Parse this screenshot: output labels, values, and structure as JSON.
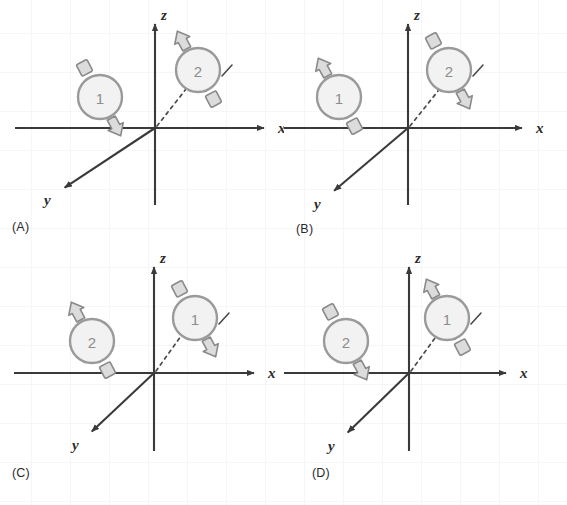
{
  "figure": {
    "type": "physics-diagram",
    "colors": {
      "axis": "#3a3a3a",
      "circle_stroke": "#9a9a9a",
      "circle_fill": "#f2f2f2",
      "arrow_stroke": "#8a8a8a",
      "arrow_fill": "#dcdcdc",
      "dash": "#4a4a4a",
      "text": "#2b2b2b",
      "number": "#8d8d8d",
      "grid": "#f6f6f7",
      "background": "#ffffff"
    },
    "axes": {
      "z_label": "z",
      "x_label": "x",
      "y_label": "y"
    }
  },
  "panels": [
    {
      "id": "A",
      "label": "(A)",
      "axes": {
        "z_label": "z",
        "x_label": "x",
        "y_label": "y"
      },
      "objects": [
        {
          "name": "circle-1",
          "number": "1",
          "position": "left-of-z-axis",
          "cx": 100,
          "cy": 97,
          "arrow_tilt_deg": -28,
          "head_end": "bottom-left",
          "tail_end": "top-right"
        },
        {
          "name": "circle-2",
          "number": "2",
          "position": "on-dashed-line",
          "cx": 198,
          "cy": 70,
          "arrow_tilt_deg": -28,
          "head_end": "top-left",
          "tail_end": "bottom-right"
        }
      ]
    },
    {
      "id": "B",
      "label": "(B)",
      "axes": {
        "z_label": "z",
        "x_label": "x",
        "y_label": "y"
      },
      "objects": [
        {
          "name": "circle-1",
          "number": "1",
          "position": "left-of-z-axis",
          "cx": 55,
          "cy": 97,
          "arrow_tilt_deg": -28,
          "head_end": "top-left",
          "tail_end": "bottom-right"
        },
        {
          "name": "circle-2",
          "number": "2",
          "position": "on-dashed-line",
          "cx": 165,
          "cy": 70,
          "arrow_tilt_deg": -28,
          "head_end": "bottom-left",
          "tail_end": "top-right"
        }
      ]
    },
    {
      "id": "C",
      "label": "(C)",
      "axes": {
        "z_label": "z",
        "x_label": "x",
        "y_label": "y"
      },
      "objects": [
        {
          "name": "circle-2",
          "number": "2",
          "position": "left-of-z-axis",
          "cx": 92,
          "cy": 88,
          "arrow_tilt_deg": -28,
          "head_end": "top-left",
          "tail_end": "bottom-right"
        },
        {
          "name": "circle-1",
          "number": "1",
          "position": "on-dashed-line",
          "cx": 195,
          "cy": 65,
          "arrow_tilt_deg": -28,
          "head_end": "bottom-left",
          "tail_end": "top-right"
        }
      ]
    },
    {
      "id": "D",
      "label": "(D)",
      "axes": {
        "z_label": "z",
        "x_label": "x",
        "y_label": "y"
      },
      "objects": [
        {
          "name": "circle-2",
          "number": "2",
          "position": "left-of-z-axis",
          "cx": 62,
          "cy": 88,
          "arrow_tilt_deg": -28,
          "head_end": "bottom-left",
          "tail_end": "top-right"
        },
        {
          "name": "circle-1",
          "number": "1",
          "position": "on-dashed-line",
          "cx": 163,
          "cy": 65,
          "arrow_tilt_deg": -28,
          "head_end": "top-left",
          "tail_end": "bottom-right"
        }
      ]
    }
  ]
}
